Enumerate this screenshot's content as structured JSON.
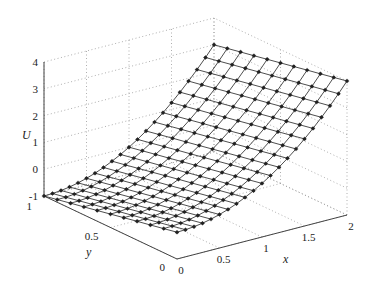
{
  "chart_data": {
    "type": "surface3d",
    "title": "",
    "function_fit": "U = x^2 - y",
    "xlabel": "x",
    "ylabel": "y",
    "zlabel": "U",
    "xlim": [
      0,
      2
    ],
    "ylim": [
      0,
      1
    ],
    "zlim": [
      -1,
      4
    ],
    "x_ticks": [
      "0",
      "0.5",
      "1",
      "1.5",
      "2"
    ],
    "y_ticks": [
      "0",
      "0.5",
      "1"
    ],
    "z_ticks": [
      "-1",
      "0",
      "1",
      "2",
      "3",
      "4"
    ],
    "grid": true,
    "grid_style": "dotted",
    "marker": "asterisk",
    "x": [
      0,
      0.1,
      0.2,
      0.3,
      0.4,
      0.5,
      0.6,
      0.7,
      0.8,
      0.9,
      1.0,
      1.1,
      1.2,
      1.3,
      1.4,
      1.5,
      1.6,
      1.7,
      1.8,
      1.9,
      2.0
    ],
    "y": [
      0,
      0.1,
      0.2,
      0.3,
      0.4,
      0.5,
      0.6,
      0.7,
      0.8,
      0.9,
      1.0
    ],
    "corner_values": {
      "U(0,0)": 0,
      "U(0,1)": -1,
      "U(2,0)": 4,
      "U(2,1)": 3
    }
  },
  "colors": {
    "mesh": "#3a3a3a",
    "marker": "#222222",
    "axis": "#444444",
    "grid": "#9a9a9a",
    "background": "#ffffff"
  },
  "labels": {
    "x_axis": "x",
    "y_axis": "y",
    "z_axis": "U"
  }
}
